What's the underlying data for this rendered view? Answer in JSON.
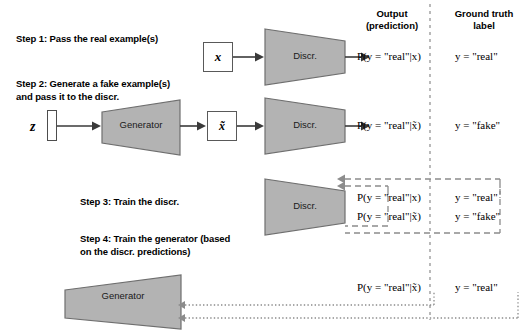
{
  "diagram": {
    "title_hidden": "",
    "columns": {
      "output": "Output\n(prediction)",
      "output_line1": "Output",
      "output_line2": "(prediction)",
      "ground_truth_line1": "Ground truth",
      "ground_truth_line2": "label"
    },
    "steps": [
      {
        "id": "step1",
        "text": "Step 1: Pass the real example(s)"
      },
      {
        "id": "step2",
        "text": "Step 2: Generate a fake example(s)\nand pass it to the discr."
      },
      {
        "id": "step3",
        "text": "Step 3: Train the discr."
      },
      {
        "id": "step4",
        "text": "Step 4: Train the generator (based\non  the discr. predictions)"
      }
    ],
    "shapes": {
      "discriminator_label": "Discr.",
      "generator_label": "Generator",
      "real_sample_label": "x",
      "fake_sample_label": "x̃",
      "noise_label": "z"
    },
    "predictions": {
      "row1": "P(y = \"real\"|x)",
      "row2": "P(y = \"real\"|x̃)",
      "row3": "P(y = \"real\"|x)",
      "row4": "P(y = \"real\"|x̃)",
      "row5": "P(y = \"real\"|x̃)"
    },
    "labels": {
      "row1": "y = \"real\"",
      "row2": "y = \"fake\"",
      "row3": "y = \"real\"",
      "row4": "y = \"fake\"",
      "row5": "y = \"real\""
    },
    "colors": {
      "shape_fill": "#b3b3b3",
      "shape_stroke": "#6e6e6e",
      "arrow": "#3a3a3a",
      "dashed": "#8c8c8c",
      "divider": "#8c8c8c",
      "text": "#000000"
    }
  }
}
